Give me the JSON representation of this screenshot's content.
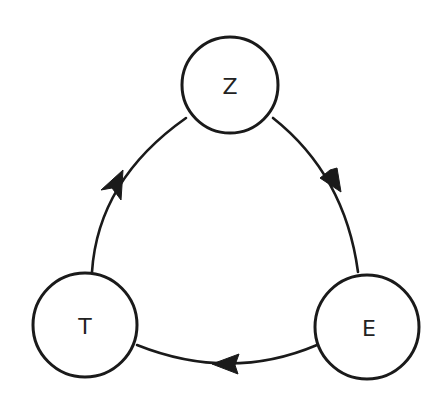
{
  "diagram": {
    "type": "directed-cycle",
    "colors": {
      "stroke": "#1a1a1a",
      "fill": "#ffffff",
      "text": "#222222"
    },
    "nodes": [
      {
        "id": "Z",
        "label": "Z",
        "cx": 230,
        "cy": 85,
        "r": 48
      },
      {
        "id": "T",
        "label": "T",
        "cx": 85,
        "cy": 325,
        "r": 52
      },
      {
        "id": "E",
        "label": "E",
        "cx": 367,
        "cy": 327,
        "r": 52
      }
    ],
    "edges": [
      {
        "from": "Z",
        "to": "E"
      },
      {
        "from": "E",
        "to": "T"
      },
      {
        "from": "T",
        "to": "Z"
      }
    ]
  }
}
